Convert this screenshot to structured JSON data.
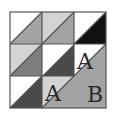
{
  "diagram": {
    "type": "quilt-block",
    "grid": {
      "rows": 3,
      "cols": 3
    },
    "colors": {
      "white": "#ffffff",
      "light": "#d4d4d4",
      "medium": "#a3a3a3",
      "mediumDark": "#7e7e7e",
      "dark": "#4a4a4a",
      "black": "#111111",
      "line": "#555555"
    },
    "cells": [
      {
        "row": 1,
        "col": 1,
        "upper": "white",
        "lower": "medium"
      },
      {
        "row": 1,
        "col": 2,
        "upper": "light",
        "lower": "medium"
      },
      {
        "row": 1,
        "col": 3,
        "upper": "white",
        "lower": "black"
      },
      {
        "row": 2,
        "col": 1,
        "upper": "light",
        "lower": "mediumDark"
      },
      {
        "row": 2,
        "col": 2,
        "upper": "white",
        "lower": "dark"
      },
      {
        "row": 2,
        "col": 3,
        "upper": "white",
        "lower": "medium"
      },
      {
        "row": 3,
        "col": 1,
        "upper": "white",
        "lower": "dark"
      },
      {
        "row": 3,
        "col": 2,
        "upper": "light",
        "lower": "medium"
      },
      {
        "row": 3,
        "col": 3,
        "upper": "medium",
        "lower": "medium"
      }
    ],
    "labels": [
      {
        "text": "A",
        "cell": "2-3",
        "region": "upper-triangle"
      },
      {
        "text": "A",
        "cell": "3-2",
        "region": "upper-triangle"
      },
      {
        "text": "B",
        "cell": "3-3",
        "region": "large-lower-triangle"
      }
    ]
  }
}
